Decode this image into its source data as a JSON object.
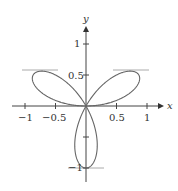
{
  "chart_data": {
    "type": "line",
    "title": "",
    "subtitle": "",
    "xlabel": "x",
    "ylabel": "y",
    "xlim": [
      -1.05,
      1.15
    ],
    "ylim": [
      -1.15,
      1.35
    ],
    "grid": false,
    "legend": null,
    "x_ticks": [
      -1,
      -0.5,
      0.5,
      1
    ],
    "x_tick_labels": [
      "−1",
      "−0.5",
      "0.5",
      "1"
    ],
    "y_ticks": [
      -1,
      -0.5,
      0.5,
      1
    ],
    "y_tick_labels": [
      "−1",
      "",
      "0.5",
      "1"
    ],
    "series": [
      {
        "name": "three-leaved rose r = sin(3θ)",
        "kind": "polar",
        "equation": "r = sin(3θ)",
        "theta_range": [
          0,
          3.14159
        ],
        "color": "#666666"
      }
    ],
    "annotations": [
      {
        "type": "horizontal_tangent",
        "y": 0.577,
        "x_range": [
          -1.0,
          -0.45
        ]
      },
      {
        "type": "horizontal_tangent",
        "y": 0.577,
        "x_range": [
          0.45,
          1.0
        ]
      },
      {
        "type": "horizontal_tangent",
        "y": -1,
        "x_range": [
          -0.28,
          0.3
        ]
      }
    ]
  },
  "axes": {
    "x_label": "x",
    "y_label": "y",
    "x_tick_labels": [
      "−1",
      "−0.5",
      "0.5",
      "1"
    ],
    "y_tick_labels": [
      "1",
      "0.5",
      "−1"
    ]
  },
  "colors": {
    "curve": "#666666",
    "axis": "#444444",
    "tangent": "#aaaaaa"
  }
}
